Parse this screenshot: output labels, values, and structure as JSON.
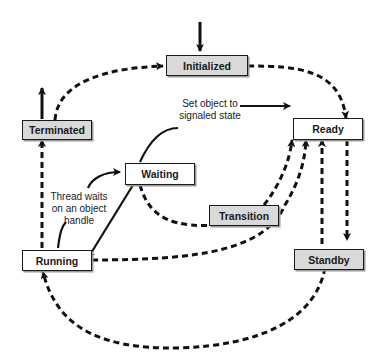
{
  "diagram": {
    "type": "state-transition",
    "colors": {
      "line": "#111111",
      "shaded_box": "#d9d9d9",
      "plain_box": "#ffffff"
    },
    "states": {
      "initialized": {
        "label": "Initialized",
        "style": "shaded"
      },
      "ready": {
        "label": "Ready",
        "style": "plain"
      },
      "terminated": {
        "label": "Terminated",
        "style": "shaded"
      },
      "waiting": {
        "label": "Waiting",
        "style": "plain"
      },
      "transition": {
        "label": "Transition",
        "style": "shaded"
      },
      "running": {
        "label": "Running",
        "style": "plain"
      },
      "standby": {
        "label": "Standby",
        "style": "shaded"
      }
    },
    "annotations": {
      "set_object": {
        "line1": "Set object to",
        "line2": "signaled state"
      },
      "thread_waits": {
        "line1": "Thread waits",
        "line2": "on an object",
        "line3": "handle"
      }
    },
    "transitions": [
      {
        "from": "entry",
        "to": "Initialized",
        "style": "solid"
      },
      {
        "from": "Initialized",
        "to": "Ready",
        "style": "dashed"
      },
      {
        "from": "Terminated",
        "to": "Initialized",
        "style": "dashed"
      },
      {
        "from": "Terminated",
        "to": "exit",
        "style": "solid"
      },
      {
        "from": "Running",
        "to": "Terminated",
        "style": "dashed"
      },
      {
        "from": "Waiting",
        "to": "Ready",
        "style": "solid",
        "label": "Set object to signaled state"
      },
      {
        "from": "Running",
        "to": "Waiting",
        "style": "solid",
        "label": "Thread waits on an object handle"
      },
      {
        "from": "Waiting",
        "to": "Running",
        "style": "solid"
      },
      {
        "from": "Waiting",
        "to": "Transition",
        "style": "dashed"
      },
      {
        "from": "Transition",
        "to": "Ready",
        "style": "dashed"
      },
      {
        "from": "Running",
        "to": "Ready",
        "style": "dashed"
      },
      {
        "from": "Ready",
        "to": "Standby",
        "style": "dashed"
      },
      {
        "from": "Standby",
        "to": "Ready",
        "style": "dashed"
      },
      {
        "from": "Standby",
        "to": "Running",
        "style": "dashed"
      }
    ]
  }
}
